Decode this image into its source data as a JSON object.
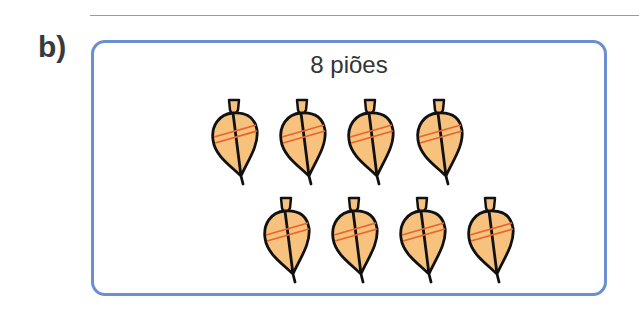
{
  "exercise": {
    "label": "b)",
    "caption": "8 piões",
    "count": 8,
    "item_icon": "spinning-top-icon",
    "rows": [
      {
        "count": 4,
        "positions": [
          [
            209,
            98
          ],
          [
            277,
            98
          ],
          [
            345,
            98
          ],
          [
            414,
            98
          ]
        ]
      },
      {
        "count": 4,
        "positions": [
          [
            261,
            196
          ],
          [
            329,
            196
          ],
          [
            397,
            196
          ],
          [
            465,
            196
          ]
        ]
      }
    ]
  },
  "colors": {
    "box_border": "#6b8fcf",
    "top_fill": "#f6c27e",
    "top_stripe": "#e8642c",
    "outline": "#111111"
  }
}
